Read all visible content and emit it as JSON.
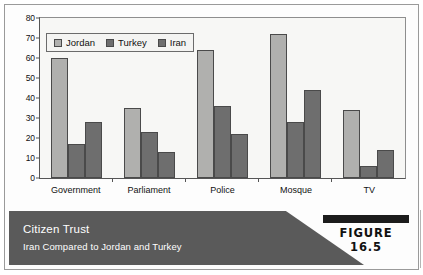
{
  "figure": {
    "caption_title": "Citizen Trust",
    "caption_subtitle": "Iran Compared to Jordan and Turkey",
    "figure_label": "FIGURE 16.5"
  },
  "colors": {
    "jordan": "#b0b0ae",
    "turkey": "#6e6e6e",
    "iran": "#6e6e6e",
    "caption_band": "#5a5a5a",
    "plot_background": "#f7f7f5",
    "axis": "#555555"
  },
  "chart_data": {
    "type": "bar",
    "title": "Citizen Trust",
    "subtitle": "Iran Compared to Jordan and Turkey",
    "xlabel": "",
    "ylabel": "",
    "ylim": [
      0,
      80
    ],
    "yticks": [
      0,
      10,
      20,
      30,
      40,
      50,
      60,
      70,
      80
    ],
    "grid": false,
    "legend_position": "top-left",
    "categories": [
      "Government",
      "Parliament",
      "Police",
      "Mosque",
      "TV"
    ],
    "series": [
      {
        "name": "Jordan",
        "values": [
          60,
          35,
          64,
          72,
          34
        ]
      },
      {
        "name": "Turkey",
        "values": [
          17,
          23,
          36,
          28,
          6
        ]
      },
      {
        "name": "Iran",
        "values": [
          28,
          13,
          22,
          44,
          14
        ]
      }
    ]
  }
}
